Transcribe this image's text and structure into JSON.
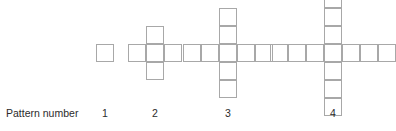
{
  "figure": {
    "caption_label": "Pattern number",
    "cell_size": 18,
    "axis_y": 53,
    "stroke_color": "#a8a8a8",
    "text_color": "#2b2b2b",
    "background": "#ffffff",
    "shape": "plus",
    "patterns": [
      {
        "label": "1",
        "center_x": 105,
        "arm_length": 0,
        "square_count": 1,
        "width_in_cells": 1,
        "height_in_cells": 1
      },
      {
        "label": "2",
        "center_x": 155,
        "arm_length": 1,
        "square_count": 5,
        "width_in_cells": 3,
        "height_in_cells": 3
      },
      {
        "label": "3",
        "center_x": 228,
        "arm_length": 2,
        "square_count": 9,
        "width_in_cells": 5,
        "height_in_cells": 5
      },
      {
        "label": "4",
        "center_x": 333,
        "arm_length": 3,
        "square_count": 13,
        "width_in_cells": 7,
        "height_in_cells": 7
      }
    ]
  }
}
